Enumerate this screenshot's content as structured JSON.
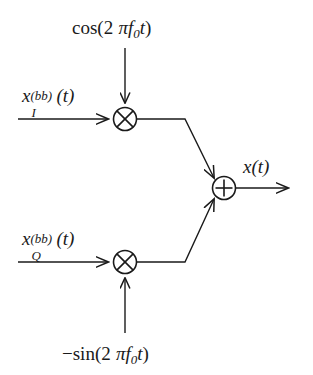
{
  "diagram": {
    "name": "quadrature-modulator-block-diagram",
    "type": "signal-flow",
    "background_color": "#ffffff",
    "line_color": "#1a1a1a",
    "text_color": "#1a1a1a"
  },
  "carriers": {
    "cosine": {
      "prefix": "cos(2",
      "pi": "π",
      "f": "f",
      "f_subscript": "0",
      "t": "t",
      "suffix": ")",
      "full": "cos(2 πf0t)"
    },
    "sine": {
      "minus": "−",
      "prefix": "sin(2",
      "pi": "π",
      "f": "f",
      "f_subscript": "0",
      "t": "t",
      "suffix": ")",
      "full": "−sin(2 πf0t)"
    }
  },
  "inputs": {
    "i_channel": {
      "base": "x",
      "superscript": "(bb)",
      "subscript": "I",
      "argument": "(t)",
      "full": "x_I^(bb)(t)"
    },
    "q_channel": {
      "base": "x",
      "superscript": "(bb)",
      "subscript": "Q",
      "argument": "(t)",
      "full": "x_Q^(bb)(t)"
    }
  },
  "output": {
    "base": "x",
    "argument": "(t)",
    "full": "x(t)"
  },
  "operators": {
    "mixer_i": {
      "symbol": "⊗",
      "label": "multiplier"
    },
    "mixer_q": {
      "symbol": "⊗",
      "label": "multiplier"
    },
    "summer": {
      "symbol": "⊕",
      "label": "adder"
    }
  }
}
